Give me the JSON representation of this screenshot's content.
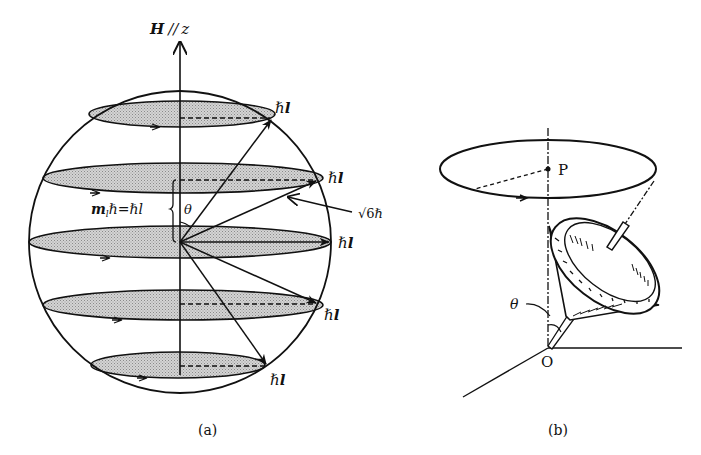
{
  "figure": {
    "panel_a": {
      "caption": "(a)",
      "axis_label_H": "H",
      "axis_label_parallel": "//",
      "axis_label_z": "z",
      "vector_label_hbar": "ℏ",
      "vector_label_l": "l",
      "projection_label_m": "m",
      "projection_label_sub": "l",
      "projection_label_rest": "ℏ=ℏl",
      "angle_label": "θ",
      "magnitude_label_root": "√6",
      "magnitude_label_hbar": "ℏ",
      "ml_levels": [
        2,
        1,
        0,
        -1,
        -2
      ],
      "fill_color": "#c9c9c9",
      "line_color": "#111111"
    },
    "panel_b": {
      "caption": "(b)",
      "point_P": "P",
      "origin_O": "O",
      "angle_label": "θ"
    }
  }
}
